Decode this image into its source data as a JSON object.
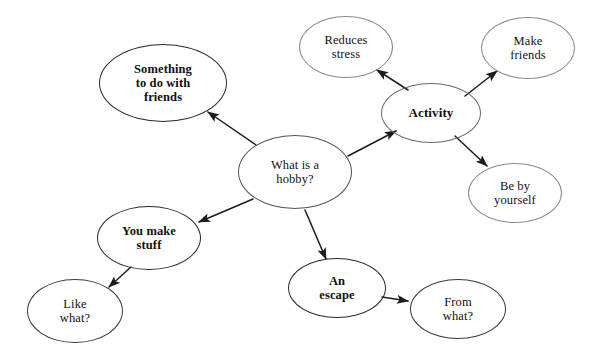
{
  "diagram": {
    "type": "mind-map",
    "background_color": "#ffffff",
    "text_color": "#111111",
    "stroke_dark": "#2b2b2b",
    "stroke_light": "#9b9b9b",
    "arrow_color": "#1c1c1c"
  },
  "nodes": [
    {
      "id": "center",
      "label": "What is a\nhobby?",
      "cx": 295,
      "cy": 172,
      "rx": 57,
      "ry": 37,
      "weight": "regular",
      "font_size": 12.5,
      "stroke": "#555555",
      "stroke_width": 1.2
    },
    {
      "id": "something-friends",
      "label": "Something\nto do with\nfriends",
      "cx": 163,
      "cy": 83,
      "rx": 64,
      "ry": 39,
      "weight": "bold",
      "font_size": 12.5,
      "stroke": "#2b2b2b",
      "stroke_width": 1.4
    },
    {
      "id": "activity",
      "label": "Activity",
      "cx": 431,
      "cy": 113,
      "rx": 50,
      "ry": 30,
      "weight": "bold",
      "font_size": 13,
      "stroke": "#6a6a6a",
      "stroke_width": 1.3
    },
    {
      "id": "reduces-stress",
      "label": "Reduces\nstress",
      "cx": 346,
      "cy": 47,
      "rx": 47,
      "ry": 31,
      "weight": "regular",
      "font_size": 12.5,
      "stroke": "#8a8a8a",
      "stroke_width": 1.2
    },
    {
      "id": "make-friends",
      "label": "Make\nfriends",
      "cx": 528,
      "cy": 48,
      "rx": 47,
      "ry": 31,
      "weight": "regular",
      "font_size": 12.5,
      "stroke": "#8a8a8a",
      "stroke_width": 1.2
    },
    {
      "id": "be-by-yourself",
      "label": "Be by\nyourself",
      "cx": 515,
      "cy": 193,
      "rx": 47,
      "ry": 30,
      "weight": "regular",
      "font_size": 12.5,
      "stroke": "#8a8a8a",
      "stroke_width": 1.2
    },
    {
      "id": "you-make-stuff",
      "label": "You make\nstuff",
      "cx": 149,
      "cy": 238,
      "rx": 52,
      "ry": 32,
      "weight": "bold",
      "font_size": 12.5,
      "stroke": "#2b2b2b",
      "stroke_width": 1.4
    },
    {
      "id": "like-what",
      "label": "Like\nwhat?",
      "cx": 75,
      "cy": 311,
      "rx": 48,
      "ry": 32,
      "weight": "regular",
      "font_size": 12.5,
      "stroke": "#3a3a3a",
      "stroke_width": 1.2
    },
    {
      "id": "an-escape",
      "label": "An\nescape",
      "cx": 337,
      "cy": 288,
      "rx": 49,
      "ry": 30,
      "weight": "bold",
      "font_size": 12.5,
      "stroke": "#2b2b2b",
      "stroke_width": 1.4
    },
    {
      "id": "from-what",
      "label": "From\nwhat?",
      "cx": 458,
      "cy": 309,
      "rx": 48,
      "ry": 30,
      "weight": "regular",
      "font_size": 12.5,
      "stroke": "#3a3a3a",
      "stroke_width": 1.2
    }
  ],
  "edges": [
    {
      "id": "center-to-something-friends",
      "from": "center",
      "to": "something-friends",
      "x1": 256,
      "y1": 145,
      "x2": 208,
      "y2": 112,
      "arrowhead": "end"
    },
    {
      "id": "center-to-activity",
      "from": "center",
      "to": "activity",
      "x1": 348,
      "y1": 156,
      "x2": 396,
      "y2": 131,
      "arrowhead": "end"
    },
    {
      "id": "center-to-you-make-stuff",
      "from": "center",
      "to": "you-make-stuff",
      "x1": 253,
      "y1": 199,
      "x2": 199,
      "y2": 222,
      "arrowhead": "end"
    },
    {
      "id": "center-to-an-escape",
      "from": "center",
      "to": "an-escape",
      "x1": 305,
      "y1": 210,
      "x2": 326,
      "y2": 259,
      "arrowhead": "end"
    },
    {
      "id": "activity-to-reduces-stress",
      "from": "activity",
      "to": "reduces-stress",
      "x1": 408,
      "y1": 90,
      "x2": 377,
      "y2": 70,
      "arrowhead": "end"
    },
    {
      "id": "activity-to-make-friends",
      "from": "activity",
      "to": "make-friends",
      "x1": 465,
      "y1": 96,
      "x2": 497,
      "y2": 71,
      "arrowhead": "end"
    },
    {
      "id": "activity-to-be-by-yourself",
      "from": "activity",
      "to": "be-by-yourself",
      "x1": 455,
      "y1": 136,
      "x2": 487,
      "y2": 166,
      "arrowhead": "end"
    },
    {
      "id": "you-make-stuff-to-like-what",
      "from": "you-make-stuff",
      "to": "like-what",
      "x1": 131,
      "y1": 267,
      "x2": 109,
      "y2": 287,
      "arrowhead": "end"
    },
    {
      "id": "an-escape-to-from-what",
      "from": "an-escape",
      "to": "from-what",
      "x1": 382,
      "y1": 297,
      "x2": 408,
      "y2": 301,
      "arrowhead": "end"
    }
  ]
}
